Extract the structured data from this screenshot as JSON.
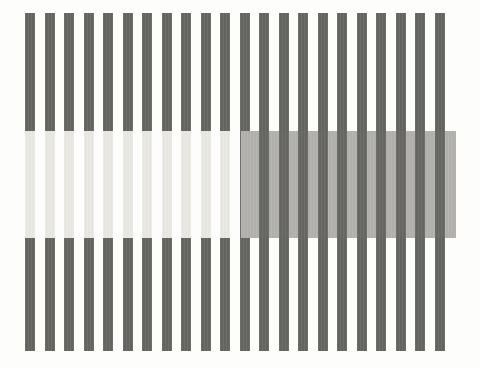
{
  "figure": {
    "caption": "",
    "colors": {
      "background": "#fdfdfc",
      "stripe_dark": "#666663",
      "stripe_light": "#ffffff",
      "test_patch_left": "#ebeae5",
      "test_patch_right": "#b3b2ae"
    },
    "geometry": {
      "canvas_width": 480,
      "canvas_height": 368,
      "pattern_left": 25,
      "pattern_top": 13,
      "pattern_width": 431,
      "pattern_height": 338,
      "stripe_count": 22,
      "stripe_width": 10,
      "stripe_period": 19.5,
      "band_top": 131,
      "band_bottom": 238,
      "band_split_x": 241
    },
    "stripes": [
      {
        "index": 0,
        "x": 0
      },
      {
        "index": 1,
        "x": 19.5
      },
      {
        "index": 2,
        "x": 39
      },
      {
        "index": 3,
        "x": 58.5
      },
      {
        "index": 4,
        "x": 78
      },
      {
        "index": 5,
        "x": 97.5
      },
      {
        "index": 6,
        "x": 117
      },
      {
        "index": 7,
        "x": 136.5
      },
      {
        "index": 8,
        "x": 156
      },
      {
        "index": 9,
        "x": 175.5
      },
      {
        "index": 10,
        "x": 195
      },
      {
        "index": 11,
        "x": 214.5
      },
      {
        "index": 12,
        "x": 234
      },
      {
        "index": 13,
        "x": 253.5
      },
      {
        "index": 14,
        "x": 273
      },
      {
        "index": 15,
        "x": 292.5
      },
      {
        "index": 16,
        "x": 312
      },
      {
        "index": 17,
        "x": 331.5
      },
      {
        "index": 18,
        "x": 351
      },
      {
        "index": 19,
        "x": 370.5
      },
      {
        "index": 20,
        "x": 390
      },
      {
        "index": 21,
        "x": 409.5
      }
    ],
    "bands": [
      {
        "id": "left",
        "name": "light-test-band",
        "mode": "patches-on-dark-stripes",
        "patch_color": "#ebeae5",
        "surround": "#ffffff",
        "x_start": 0,
        "x_end": 216,
        "patch_indices": [
          0,
          1,
          2,
          3,
          4,
          5,
          6,
          7,
          8,
          9,
          10
        ]
      },
      {
        "id": "right",
        "name": "gray-test-band",
        "mode": "gray-fill-behind-dark-stripes",
        "patch_color": "#b3b2ae",
        "surround": "#666663",
        "x_start": 216,
        "x_end": 431,
        "stripe_indices": [
          12,
          13,
          14,
          15,
          16,
          17,
          18,
          19,
          20,
          21
        ]
      }
    ]
  }
}
